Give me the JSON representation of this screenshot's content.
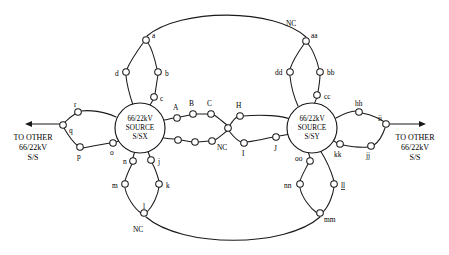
{
  "diagram": {
    "type": "single-line-network-diagram",
    "colors": {
      "line": "#1a1a1a",
      "node_fill": "#ffffff",
      "background": "#ffffff"
    }
  },
  "sources": [
    {
      "id": "ssx",
      "lines": [
        "66/22kV",
        "SOURCE",
        "S/SX"
      ],
      "cx": 140,
      "cy": 128,
      "r": 25
    },
    {
      "id": "ssy",
      "lines": [
        "66/22kV",
        "SOURCE",
        "S/SY"
      ],
      "cx": 312,
      "cy": 128,
      "r": 25
    }
  ],
  "terminals": [
    {
      "id": "left-terminal",
      "lines": [
        "TO OTHER",
        "66/22kV",
        "S/S"
      ],
      "x": 33,
      "y": 140,
      "arrow_dir": "left",
      "arrow": {
        "x1": 58,
        "y1": 124,
        "x2": 25,
        "y2": 124
      }
    },
    {
      "id": "right-terminal",
      "lines": [
        "TO OTHER",
        "66/22kV",
        "S/S"
      ],
      "x": 415,
      "y": 140,
      "arrow_dir": "right",
      "arrow": {
        "x1": 392,
        "y1": 124,
        "x2": 426,
        "y2": 124
      }
    }
  ],
  "nodes": [
    {
      "id": "a",
      "label": "a",
      "x": 146,
      "y": 40,
      "lx": 152,
      "ly": 38,
      "underline": false
    },
    {
      "id": "b",
      "label": "b",
      "x": 158,
      "y": 72,
      "lx": 165,
      "ly": 76,
      "underline": false
    },
    {
      "id": "c",
      "label": "c",
      "x": 154,
      "y": 97,
      "lx": 160,
      "ly": 101,
      "underline": false
    },
    {
      "id": "d",
      "label": "d",
      "x": 126,
      "y": 72,
      "lx": 115,
      "ly": 76,
      "underline": false
    },
    {
      "id": "r",
      "label": "r",
      "x": 78,
      "y": 112,
      "lx": 74,
      "ly": 106,
      "underline": false
    },
    {
      "id": "q",
      "label": "q",
      "x": 63,
      "y": 125,
      "lx": 69,
      "ly": 133,
      "underline": false
    },
    {
      "id": "p",
      "label": "p",
      "x": 80,
      "y": 147,
      "lx": 77,
      "ly": 158,
      "underline": false
    },
    {
      "id": "o",
      "label": "o",
      "x": 113,
      "y": 143,
      "lx": 110,
      "ly": 155,
      "underline": false
    },
    {
      "id": "n",
      "label": "n",
      "x": 133,
      "y": 161,
      "lx": 123,
      "ly": 163,
      "underline": false
    },
    {
      "id": "j",
      "label": "j",
      "x": 151,
      "y": 160,
      "lx": 158,
      "ly": 163,
      "underline": false
    },
    {
      "id": "m",
      "label": "m",
      "x": 125,
      "y": 184,
      "lx": 114,
      "ly": 188,
      "underline": false
    },
    {
      "id": "k",
      "label": "k",
      "x": 159,
      "y": 184,
      "lx": 166,
      "ly": 188,
      "underline": false
    },
    {
      "id": "l",
      "label": "l",
      "x": 144,
      "y": 213,
      "lx": 143,
      "ly": 209,
      "underline": false
    },
    {
      "id": "A",
      "label": "A",
      "x": 177,
      "y": 118,
      "lx": 173,
      "ly": 111,
      "underline": false
    },
    {
      "id": "B",
      "label": "B",
      "x": 193,
      "y": 114,
      "lx": 190,
      "ly": 107,
      "underline": false
    },
    {
      "id": "C",
      "label": "C",
      "x": 211,
      "y": 114,
      "lx": 208,
      "ly": 107,
      "underline": false
    },
    {
      "id": "ncj",
      "label": "NC",
      "x": 228,
      "y": 128,
      "lx": 219,
      "ly": 146,
      "underline": false
    },
    {
      "id": "H",
      "label": "H",
      "x": 240,
      "y": 116,
      "lx": 237,
      "ly": 109,
      "underline": false
    },
    {
      "id": "u1",
      "label": "",
      "x": 178,
      "y": 140,
      "lx": 0,
      "ly": 0,
      "underline": false
    },
    {
      "id": "u2",
      "label": "",
      "x": 195,
      "y": 142,
      "lx": 0,
      "ly": 0,
      "underline": false
    },
    {
      "id": "u3",
      "label": "",
      "x": 212,
      "y": 141,
      "lx": 0,
      "ly": 0,
      "underline": false
    },
    {
      "id": "I",
      "label": "I",
      "x": 244,
      "y": 143,
      "lx": 242,
      "ly": 155,
      "underline": false
    },
    {
      "id": "J",
      "label": "J",
      "x": 276,
      "y": 137,
      "lx": 276,
      "ly": 150,
      "underline": false
    },
    {
      "id": "aa",
      "label": "aa",
      "x": 306,
      "y": 41,
      "lx": 312,
      "ly": 38,
      "underline": false
    },
    {
      "id": "bb",
      "label": "bb",
      "x": 320,
      "y": 72,
      "lx": 327,
      "ly": 74,
      "underline": false
    },
    {
      "id": "cc",
      "label": "cc",
      "x": 317,
      "y": 95,
      "lx": 324,
      "ly": 98,
      "underline": false
    },
    {
      "id": "dd",
      "label": "dd",
      "x": 290,
      "y": 72,
      "lx": 277,
      "ly": 74,
      "underline": false
    },
    {
      "id": "hh",
      "label": "hh",
      "x": 359,
      "y": 112,
      "lx": 356,
      "ly": 105,
      "underline": false
    },
    {
      "id": "ii",
      "label": "ii",
      "x": 386,
      "y": 124,
      "lx": 380,
      "ly": 121,
      "underline": false
    },
    {
      "id": "jj",
      "label": "jj",
      "x": 371,
      "y": 146,
      "lx": 368,
      "ly": 157,
      "underline": true
    },
    {
      "id": "kk",
      "label": "kk",
      "x": 340,
      "y": 144,
      "lx": 336,
      "ly": 156,
      "underline": false
    },
    {
      "id": "oo",
      "label": "oo",
      "x": 310,
      "y": 161,
      "lx": 297,
      "ly": 160,
      "underline": false
    },
    {
      "id": "nn",
      "label": "nn",
      "x": 300,
      "y": 184,
      "lx": 286,
      "ly": 187,
      "underline": false
    },
    {
      "id": "ll",
      "label": "ll",
      "x": 334,
      "y": 184,
      "lx": 341,
      "ly": 188,
      "underline": true
    },
    {
      "id": "mm",
      "label": "mm",
      "x": 320,
      "y": 213,
      "lx": 325,
      "ly": 222,
      "underline": false
    }
  ],
  "free_labels": [
    {
      "id": "nc-top",
      "text": "NC",
      "x": 292,
      "y": 26
    },
    {
      "id": "nc-bottom",
      "text": "NC",
      "x": 140,
      "y": 230
    }
  ],
  "edges": [
    "ssx-a",
    "a-b",
    "b-c",
    "c-ssx",
    "a-d",
    "d-ssx",
    "a-aa-top-arc",
    "ssx-r",
    "r-q",
    "q-p",
    "p-o",
    "o-ssx",
    "ssx-n",
    "n-m",
    "m-l",
    "l-k",
    "k-j",
    "j-ssx",
    "l-mm-bottom-arc",
    "ssx-A",
    "A-B",
    "B-C",
    "C-ncj",
    "ncj-H",
    "H-ssy",
    "ssx-u1",
    "u1-u2",
    "u2-u3",
    "u3-ncj",
    "ncj-I",
    "I-J",
    "J-ssy",
    "ssy-aa",
    "aa-bb",
    "bb-cc",
    "cc-ssy",
    "aa-dd",
    "dd-ssy",
    "ssy-hh",
    "hh-ii",
    "ii-jj",
    "jj-kk",
    "kk-ssy",
    "ssy-oo",
    "oo-nn",
    "nn-mm",
    "mm-ll",
    "ll-ssy"
  ]
}
